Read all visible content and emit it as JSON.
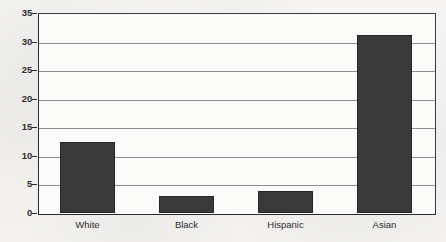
{
  "chart_data": {
    "type": "bar",
    "title": "",
    "subtitle": "",
    "xlabel": "",
    "ylabel": "",
    "categories": [
      "White",
      "Black",
      "Hispanic",
      "Asian"
    ],
    "values": [
      12.5,
      3.0,
      3.8,
      31.2
    ],
    "series": [
      {
        "name": "",
        "values": [
          12.5,
          3.0,
          3.8,
          31.2
        ]
      }
    ],
    "ylim": [
      0,
      35
    ],
    "ytick_labels": [
      "0",
      "5",
      "10",
      "15",
      "20",
      "25",
      "30",
      "35"
    ],
    "ytick_values": [
      0,
      5,
      10,
      15,
      20,
      25,
      30,
      35
    ],
    "grid": true,
    "grid_axis": "y",
    "legend": false,
    "legend_position": "none",
    "annotations": [],
    "colors": {
      "bar_fill": "#3a3a3a",
      "bar_edge": "#262626",
      "gridline": "#8e8e8e",
      "axis": "#2b2b2b",
      "plot_background": "#fbfbfa",
      "figure_background": "#f2f1ef",
      "tick_label": "#2e2e2e",
      "category_label": "#2d2d2d"
    }
  }
}
